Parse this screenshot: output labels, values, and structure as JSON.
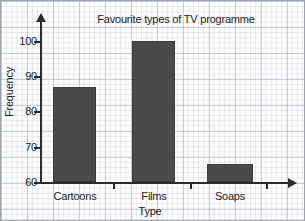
{
  "chart_data": {
    "type": "bar",
    "title": "Favourite types of TV programme",
    "xlabel": "Type",
    "ylabel": "Frequency",
    "categories": [
      "Cartoons",
      "Films",
      "Soaps"
    ],
    "values": [
      87,
      100,
      65
    ],
    "ylim": [
      60,
      102
    ],
    "yticks": [
      60,
      70,
      80,
      90,
      100
    ],
    "ytick_labels": [
      "60",
      "70",
      "80",
      "90",
      "100"
    ],
    "grid": true,
    "grid_style": "graph-paper",
    "legend": null,
    "bar_color": "#4a4a4a",
    "axis_color": "#2b2b2b",
    "background": "#fdfdfd"
  },
  "axes": {
    "y_arrow": "arrow-up-icon",
    "x_arrow": "arrow-right-icon"
  }
}
